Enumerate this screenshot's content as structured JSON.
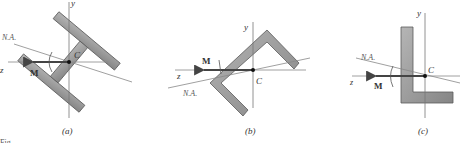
{
  "figure": {
    "panels": [
      {
        "id": "a",
        "caption": "(a)",
        "axis_y": "y",
        "axis_z": "z",
        "centroid": "C",
        "neutral_axis": "N.A.",
        "moment": "M",
        "shape": "I-beam rotated"
      },
      {
        "id": "b",
        "caption": "(b)",
        "axis_y": "y",
        "axis_z": "z",
        "centroid": "C",
        "neutral_axis": "N.A.",
        "moment": "M",
        "shape": "angle section rotated 45°"
      },
      {
        "id": "c",
        "caption": "(c)",
        "axis_y": "y",
        "axis_z": "z",
        "centroid": "C",
        "neutral_axis": "N.A.",
        "moment": "M",
        "shape": "L-angle section"
      }
    ],
    "partial_caption": "Fig."
  },
  "colors": {
    "section_fill": "#9a9a9a",
    "section_edge": "#5a5a5a",
    "axis": "#777777",
    "arrow": "#444444"
  }
}
